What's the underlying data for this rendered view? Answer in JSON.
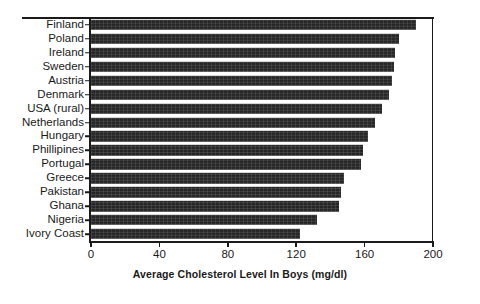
{
  "chart_data": {
    "type": "bar",
    "orientation": "horizontal",
    "title": "",
    "subtitle": "",
    "xlabel": "Average Cholesterol Level In Boys (mg/dl)",
    "ylabel": "",
    "xlim": [
      0,
      200
    ],
    "xticks": [
      0,
      40,
      80,
      120,
      160,
      200
    ],
    "xtick_labels": [
      "0",
      "40",
      "80",
      "120",
      "160",
      "200"
    ],
    "grid": false,
    "legend": null,
    "bar_color": "#262626",
    "axis_color": "#1a1a1a",
    "background": "#ffffff",
    "categories": [
      "Finland",
      "Poland",
      "Ireland",
      "Sweden",
      "Austria",
      "Denmark",
      "USA (rural)",
      "Netherlands",
      "Hungary",
      "Phillipines",
      "Portugal",
      "Greece",
      "Pakistan",
      "Ghana",
      "Nigeria",
      "Ivory Coast"
    ],
    "values": [
      190,
      180,
      178,
      177,
      176,
      174,
      170,
      166,
      162,
      159,
      158,
      148,
      146,
      145,
      132,
      122
    ]
  }
}
